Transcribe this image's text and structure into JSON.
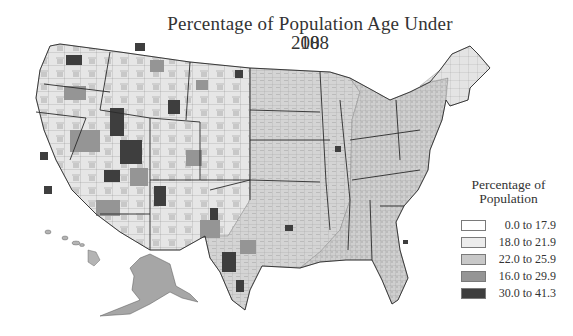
{
  "map": {
    "title": "Percentage of Population Age Under 18",
    "subtitle": "2008",
    "region": "United States (counties), incl. Alaska and Hawaii insets",
    "legend": {
      "title_line1": "Percentage of",
      "title_line2": "Population",
      "classes": [
        {
          "label": "0.0 to 17.9",
          "color": "#ffffff"
        },
        {
          "label": "18.0 to 21.9",
          "color": "#ececec"
        },
        {
          "label": "22.0 to 25.9",
          "color": "#c8c8c8"
        },
        {
          "label": "16.0 to 29.9",
          "color": "#959595"
        },
        {
          "label": "30.0 to 41.3",
          "color": "#3e3e3e"
        }
      ]
    },
    "colors": {
      "class_1": "#ffffff",
      "class_2": "#ececec",
      "class_3": "#c8c8c8",
      "class_4": "#959595",
      "class_5": "#3e3e3e",
      "border": "#2a2a2a"
    }
  }
}
